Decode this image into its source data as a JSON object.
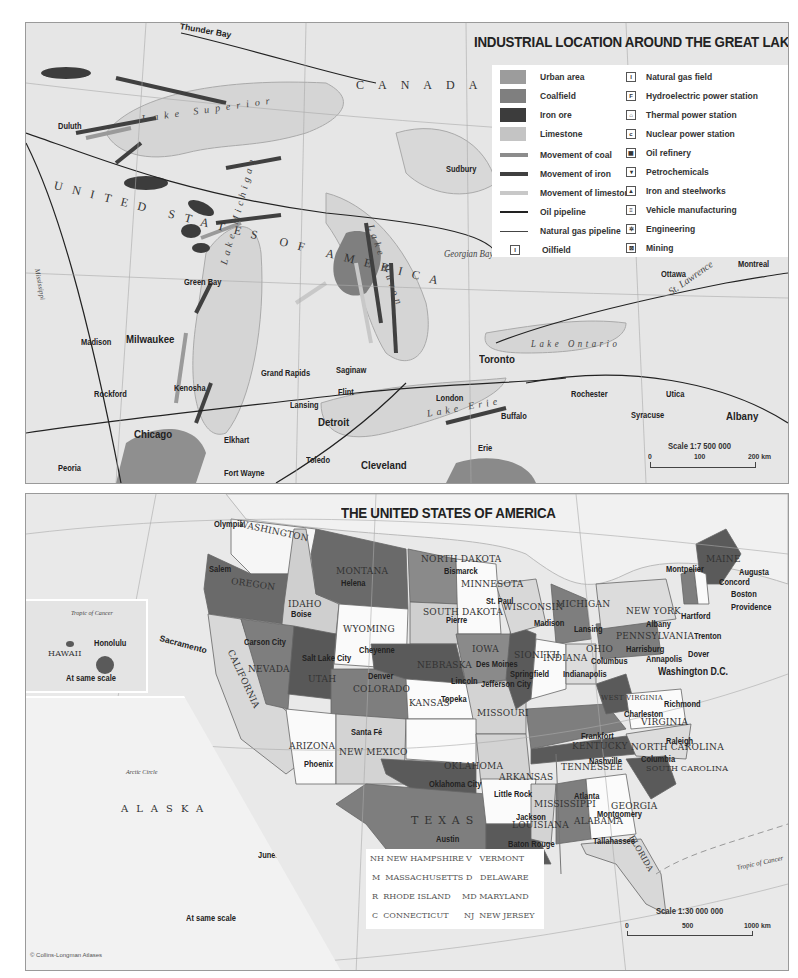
{
  "great_lakes_map": {
    "title": "INDUSTRIAL LOCATION AROUND THE GREAT LAKES",
    "country_labels": [
      "CANADA",
      "UNITED STATES OF AMERICA"
    ],
    "water_labels": [
      "Lake Superior",
      "Lake Michigan",
      "Lake Huron",
      "Lake Ontario",
      "Lake Erie",
      "Georgian Bay",
      "St. Lawrence",
      "Mississippi"
    ],
    "cities": [
      "Thunder Bay",
      "Duluth",
      "Sudbury",
      "Green Bay",
      "Madison",
      "Milwaukee",
      "Rockford",
      "Kenosha",
      "Chicago",
      "Peoria",
      "Grand Rapids",
      "Lansing",
      "Saginaw",
      "Flint",
      "Detroit",
      "Elkhart",
      "Fort Wayne",
      "Toledo",
      "Cleveland",
      "London",
      "Toronto",
      "Buffalo",
      "Erie",
      "Rochester",
      "Syracuse",
      "Utica",
      "Albany",
      "Ottawa",
      "Montreal"
    ],
    "legend": {
      "left": [
        {
          "label": "Urban area",
          "type": "swatch",
          "color": "#9c9c9c"
        },
        {
          "label": "Coalfield",
          "type": "swatch",
          "color": "#7f7f7f"
        },
        {
          "label": "Iron ore",
          "type": "swatch",
          "color": "#3c3c3c"
        },
        {
          "label": "Limestone",
          "type": "swatch",
          "color": "#c4c4c4"
        },
        {
          "label": "Movement of coal",
          "type": "arrow",
          "color": "#8c8c8c"
        },
        {
          "label": "Movement of iron",
          "type": "arrow",
          "color": "#404040"
        },
        {
          "label": "Movement of limestone",
          "type": "arrow",
          "color": "#c8c8c8"
        },
        {
          "label": "Oil pipeline",
          "type": "line",
          "color": "#222222"
        },
        {
          "label": "Natural gas pipeline",
          "type": "line",
          "color": "#444444"
        },
        {
          "label": "Oilfield",
          "type": "icon",
          "glyph": "I"
        }
      ],
      "right": [
        {
          "label": "Natural gas field",
          "glyph": "I"
        },
        {
          "label": "Hydroelectric power station",
          "glyph": "F"
        },
        {
          "label": "Thermal power station",
          "glyph": "⌂"
        },
        {
          "label": "Nuclear power station",
          "glyph": "c"
        },
        {
          "label": "Oil refinery",
          "glyph": "▦"
        },
        {
          "label": "Petrochemicals",
          "glyph": "▾"
        },
        {
          "label": "Iron and steelworks",
          "glyph": "▲"
        },
        {
          "label": "Vehicle manufacturing",
          "glyph": "≡"
        },
        {
          "label": "Engineering",
          "glyph": "✲"
        },
        {
          "label": "Mining",
          "glyph": "⊠"
        }
      ]
    },
    "scale": {
      "label": "Scale 1:7 500 000",
      "ticks": [
        "0",
        "100",
        "200 km"
      ]
    }
  },
  "usa_map": {
    "title": "THE UNITED STATES OF AMERICA",
    "states": [
      {
        "name": "WASHINGTON",
        "capital": "Olympia"
      },
      {
        "name": "OREGON",
        "capital": "Salem"
      },
      {
        "name": "IDAHO",
        "capital": "Boise"
      },
      {
        "name": "MONTANA",
        "capital": "Helena"
      },
      {
        "name": "NORTH DAKOTA",
        "capital": "Bismarck"
      },
      {
        "name": "MINNESOTA",
        "capital": "St. Paul"
      },
      {
        "name": "SOUTH DAKOTA",
        "capital": "Pierre"
      },
      {
        "name": "WYOMING",
        "capital": "Cheyenne"
      },
      {
        "name": "CALIFORNIA",
        "capital": "Sacramento"
      },
      {
        "name": "NEVADA",
        "capital": "Carson City"
      },
      {
        "name": "UTAH",
        "capital": "Salt Lake City"
      },
      {
        "name": "COLORADO",
        "capital": "Denver"
      },
      {
        "name": "NEBRASKA",
        "capital": "Lincoln"
      },
      {
        "name": "IOWA",
        "capital": "Des Moines"
      },
      {
        "name": "WISCONSIN",
        "capital": "Madison"
      },
      {
        "name": "MICHIGAN",
        "capital": "Lansing"
      },
      {
        "name": "ILLINOIS",
        "capital": "Springfield"
      },
      {
        "name": "INDIANA",
        "capital": "Indianapolis"
      },
      {
        "name": "OHIO",
        "capital": "Columbus"
      },
      {
        "name": "PENNSYLVANIA",
        "capital": "Harrisburg"
      },
      {
        "name": "NEW YORK",
        "capital": "Albany"
      },
      {
        "name": "MAINE",
        "capital": "Augusta"
      },
      {
        "name": "KANSAS",
        "capital": "Topeka"
      },
      {
        "name": "MISSOURI",
        "capital": "Jefferson City"
      },
      {
        "name": "ARIZONA",
        "capital": "Phoenix"
      },
      {
        "name": "NEW MEXICO",
        "capital": "Santa Fé"
      },
      {
        "name": "OKLAHOMA",
        "capital": "Oklahoma City"
      },
      {
        "name": "ARKANSAS",
        "capital": "Little Rock"
      },
      {
        "name": "TEXAS",
        "capital": "Austin"
      },
      {
        "name": "LOUISIANA",
        "capital": "Baton Rouge"
      },
      {
        "name": "MISSISSIPPI",
        "capital": "Jackson"
      },
      {
        "name": "ALABAMA",
        "capital": "Montgomery"
      },
      {
        "name": "GEORGIA",
        "capital": "Atlanta"
      },
      {
        "name": "FLORIDA",
        "capital": "Tallahassee"
      },
      {
        "name": "TENNESSEE",
        "capital": "Nashville"
      },
      {
        "name": "KENTUCKY",
        "capital": "Frankfort"
      },
      {
        "name": "WEST VIRGINIA",
        "capital": "Charleston"
      },
      {
        "name": "VIRGINIA",
        "capital": "Richmond"
      },
      {
        "name": "NORTH CAROLINA",
        "capital": "Raleigh"
      },
      {
        "name": "SOUTH CAROLINA",
        "capital": "Columbia"
      },
      {
        "name": "ALASKA",
        "capital": "Juneau"
      },
      {
        "name": "HAWAII",
        "capital": "Honolulu"
      }
    ],
    "small_state_capitals": [
      "Montpelier",
      "Concord",
      "Boston",
      "Providence",
      "Hartford",
      "Trenton",
      "Dover",
      "Annapolis",
      "Washington D.C."
    ],
    "abbreviations": [
      {
        "code": "NH",
        "name": "NEW HAMPSHIRE"
      },
      {
        "code": "V",
        "name": "VERMONT"
      },
      {
        "code": "M",
        "name": "MASSACHUSETTS"
      },
      {
        "code": "D",
        "name": "DELAWARE"
      },
      {
        "code": "R",
        "name": "RHODE ISLAND"
      },
      {
        "code": "MD",
        "name": "MARYLAND"
      },
      {
        "code": "C",
        "name": "CONNECTICUT"
      },
      {
        "code": "NJ",
        "name": "NEW JERSEY"
      }
    ],
    "hawaii_inset": {
      "label": "HAWAII",
      "city": "Honolulu",
      "note": "At same scale",
      "tropic": "Tropic of Cancer"
    },
    "alaska_inset": {
      "label": "ALASKA",
      "city": "Juneau",
      "note": "At same scale",
      "circle": "Arctic Circle"
    },
    "tropic_label": "Tropic of Cancer",
    "scale": {
      "label": "Scale 1:30 000 000",
      "ticks": [
        "0",
        "500",
        "1000 km"
      ]
    },
    "copyright": "© Collins-Longman Atlases"
  }
}
